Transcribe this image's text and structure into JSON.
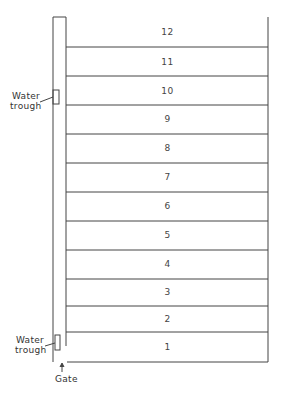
{
  "diagram": {
    "type": "paddock-layout",
    "paddocks": [
      {
        "id": "12",
        "label": "12"
      },
      {
        "id": "11",
        "label": "11"
      },
      {
        "id": "10",
        "label": "10"
      },
      {
        "id": "9",
        "label": "9"
      },
      {
        "id": "8",
        "label": "8"
      },
      {
        "id": "7",
        "label": "7"
      },
      {
        "id": "6",
        "label": "6"
      },
      {
        "id": "5",
        "label": "5"
      },
      {
        "id": "4",
        "label": "4"
      },
      {
        "id": "3",
        "label": "3"
      },
      {
        "id": "2",
        "label": "2"
      },
      {
        "id": "1",
        "label": "1"
      }
    ],
    "annotations": {
      "water_trough_top_line1": "Water",
      "water_trough_top_line2": "trough",
      "water_trough_bottom_line1": "Water",
      "water_trough_bottom_line2": "trough",
      "gate": "Gate"
    },
    "line_color": "#444444",
    "background": "#ffffff"
  }
}
